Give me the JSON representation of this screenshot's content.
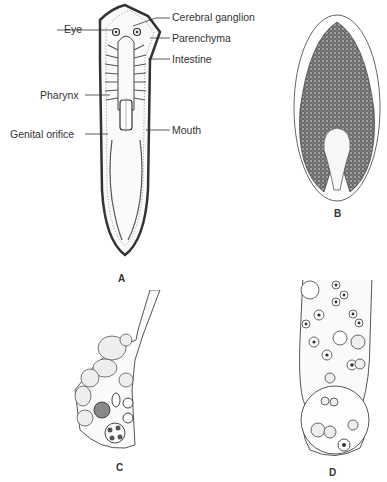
{
  "figure": {
    "panels": [
      {
        "id": "A",
        "label": "A",
        "description": "Planarian flatworm anatomy",
        "annotations": {
          "eye": "Eye",
          "cerebral_ganglion": "Cerebral ganglion",
          "parenchyma": "Parenchyma",
          "intestine": "Intestine",
          "pharynx": "Pharynx",
          "genital_orifice": "Genital orifice",
          "mouth": "Mouth"
        }
      },
      {
        "id": "B",
        "label": "B",
        "description": "Oval flatworm with dense stippled body"
      },
      {
        "id": "C",
        "label": "C",
        "description": "Flask-shaped cell cluster with vesicles"
      },
      {
        "id": "D",
        "label": "D",
        "description": "Elongated sac with nucleated cells and large vacuole"
      }
    ],
    "colors": {
      "ink": "#333333",
      "background": "#ffffff",
      "stipple": "#555555"
    }
  }
}
